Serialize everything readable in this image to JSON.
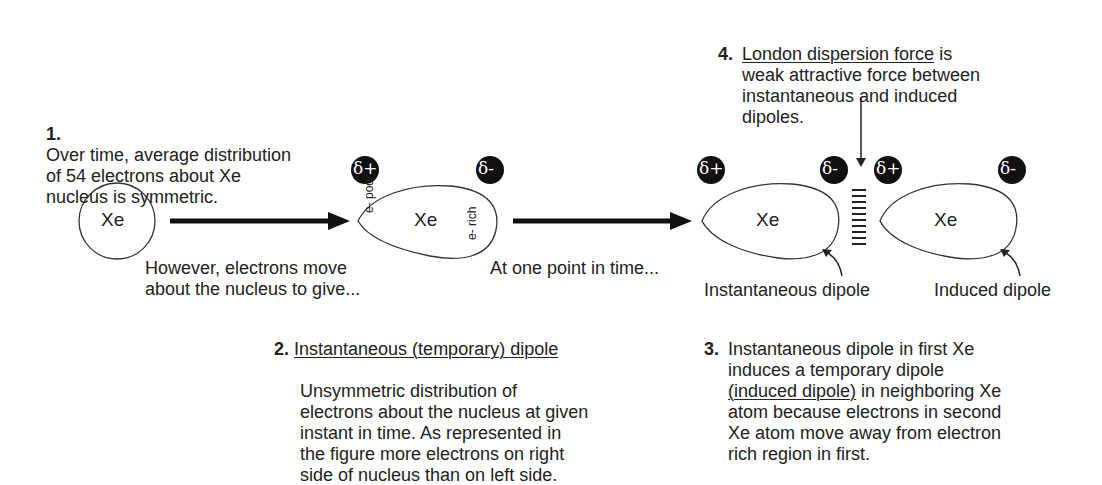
{
  "step1": {
    "number": "1.",
    "text": "Over time, average distribution\nof 54 electrons about Xe\nnucleus is symmetric."
  },
  "step2": {
    "number": "2.",
    "title": "Instantaneous (temporary) dipole",
    "text": "Unsymmetric distribution of\nelectrons about the nucleus at given\ninstant in time. As represented in\nthe figure more electrons on right\nside of nucleus than on left side."
  },
  "step3": {
    "number": "3.",
    "text_before": "Instantaneous dipole in first Xe\ninduces a temporary dipole\n",
    "underlined": "(induced dipole)",
    "text_after": " in neighboring Xe\natom because electrons in second\nXe atom move away from electron\nrich region in first."
  },
  "step4": {
    "number": "4.",
    "title": "London dispersion force",
    "text_after_title": " is\nweak attractive force between\ninstantaneous and induced\ndipoles."
  },
  "captions": {
    "move": "However, electrons move\nabout the nucleus to give...",
    "point_in_time": "At one point in time...",
    "instantaneous_dipole": "Instantaneous dipole",
    "induced_dipole": "Induced dipole"
  },
  "atoms": {
    "symbol": "Xe",
    "e_poor": "e- poor",
    "e_rich": "e- rich"
  },
  "charges": {
    "positive": "δ+",
    "negative": "δ-"
  }
}
